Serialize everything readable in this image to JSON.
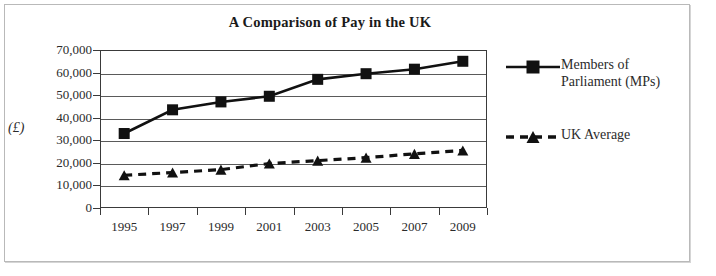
{
  "chart_data": {
    "type": "line",
    "title": "A Comparison of Pay in the UK",
    "xlabel": "",
    "ylabel": "(£)",
    "categories": [
      "1995",
      "1997",
      "1999",
      "2001",
      "2003",
      "2005",
      "2007",
      "2009"
    ],
    "x": [
      1995,
      1997,
      1999,
      2001,
      2003,
      2005,
      2007,
      2009
    ],
    "ylim": [
      0,
      70000
    ],
    "yticks": [
      0,
      10000,
      20000,
      30000,
      40000,
      50000,
      60000,
      70000
    ],
    "ytick_labels": [
      "0",
      "10,000",
      "20,000",
      "30,000",
      "40,000",
      "50,000",
      "60,000",
      "70,000"
    ],
    "grid": "horizontal",
    "legend_position": "right",
    "series": [
      {
        "name": "Members of\nParliament (MPs)",
        "legend_label": "Members of\nParliament (MPs)",
        "marker": "square",
        "line_style": "solid",
        "color": "#111111",
        "values": [
          33000,
          43500,
          47000,
          49500,
          57000,
          59500,
          61500,
          65000
        ]
      },
      {
        "name": "UK Average",
        "legend_label": "UK Average",
        "marker": "triangle",
        "line_style": "dashed",
        "color": "#111111",
        "values": [
          14500,
          15700,
          17000,
          19700,
          21000,
          22300,
          24000,
          25500
        ]
      }
    ]
  },
  "colors": {
    "ink": "#111111",
    "axis": "#3a3a3a",
    "grid": "#5a5a5a",
    "frame": "#b9b9b9",
    "text": "#2b2b2b"
  }
}
